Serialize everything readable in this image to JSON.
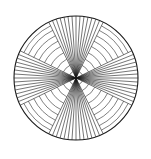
{
  "figure": {
    "name": "radial-fan-concentric-arc-figure",
    "type": "geometric-line-figure",
    "background_color": "#ffffff",
    "stroke_color": "#1a1a1a",
    "arc_stroke_color": "#3c3c3c",
    "canvas": {
      "width": 151,
      "height": 159
    }
  },
  "geometry": {
    "center_x": 76,
    "center_y": 78,
    "radius": 62,
    "outer_circle_stroke_width": 1.1,
    "radial_stroke_width": 0.6,
    "arc_stroke_width": 0.65
  },
  "chart_data": {
    "type": "line",
    "title": "",
    "subtitle": "",
    "xlabel": "",
    "ylabel": "",
    "grid": false,
    "legend_position": "none",
    "annotations": [],
    "sectors": [
      {
        "name": "top-fan",
        "center_angle_deg": -90,
        "half_width_deg": 26,
        "line_count": 15
      },
      {
        "name": "right-fan",
        "center_angle_deg": 0,
        "half_width_deg": 26,
        "line_count": 15
      },
      {
        "name": "bottom-fan",
        "center_angle_deg": 90,
        "half_width_deg": 26,
        "line_count": 15
      },
      {
        "name": "left-fan",
        "center_angle_deg": 180,
        "half_width_deg": 26,
        "line_count": 15
      }
    ],
    "arc_gaps": [
      {
        "name": "gap-upper-right",
        "start_angle_deg": -64,
        "end_angle_deg": -26
      },
      {
        "name": "gap-lower-right",
        "start_angle_deg": 26,
        "end_angle_deg": 64
      },
      {
        "name": "gap-lower-left",
        "start_angle_deg": 116,
        "end_angle_deg": 154
      },
      {
        "name": "gap-upper-left",
        "start_angle_deg": 206,
        "end_angle_deg": 244
      }
    ],
    "arc_radii": [
      7,
      14,
      21,
      28,
      35,
      41,
      47,
      53,
      58,
      62
    ],
    "arc_ring_count": 10,
    "total_radial_lines": 60
  }
}
